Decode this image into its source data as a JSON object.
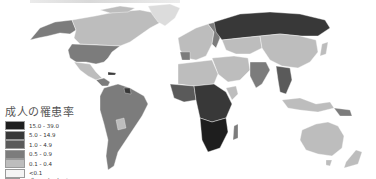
{
  "map": {
    "type": "choropleth",
    "subject": "adult prevalence by country",
    "colors": {
      "ocean": "#ffffff",
      "border": "#ffffff"
    }
  },
  "legend": {
    "title": "成人の罹患率",
    "items": [
      {
        "label": "15.0 - 39.0",
        "color": "#1e1e1e"
      },
      {
        "label": "5.0 - 14.9",
        "color": "#383838"
      },
      {
        "label": "1.0 - 4.9",
        "color": "#5a5a5a"
      },
      {
        "label": "0.5 - 0.9",
        "color": "#7c7c7c"
      },
      {
        "label": "0.1 - 0.4",
        "color": "#bdbdbd"
      },
      {
        "label": "<0.1",
        "color": "#f4f4f4"
      },
      {
        "label": "データなし",
        "color": "#dcdcdc"
      }
    ]
  },
  "regions": {
    "north_america_canada": "#bdbdbd",
    "usa": "#7c7c7c",
    "alaska": "#7c7c7c",
    "greenland": "#dcdcdc",
    "mexico": "#bdbdbd",
    "central_america": "#7c7c7c",
    "south_america": "#7c7c7c",
    "europe_west": "#bdbdbd",
    "europe_east": "#7c7c7c",
    "russia": "#383838",
    "central_asia": "#bdbdbd",
    "china": "#bdbdbd",
    "india": "#7c7c7c",
    "southeast_asia": "#5a5a5a",
    "north_africa": "#bdbdbd",
    "west_africa": "#5a5a5a",
    "central_africa": "#383838",
    "southern_africa": "#1e1e1e",
    "madagascar": "#7c7c7c",
    "middle_east": "#bdbdbd",
    "australia": "#bdbdbd",
    "new_zealand": "#bdbdbd",
    "indonesia": "#bdbdbd",
    "mongolia": "#f4f4f4"
  }
}
